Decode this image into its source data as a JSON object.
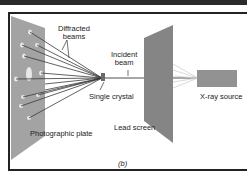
{
  "figure": {
    "labels": {
      "diffracted": [
        "Diffracted",
        "beams"
      ],
      "incident": [
        "Incident",
        "beam"
      ],
      "crystal": "Single crystal",
      "xray": "X-ray source",
      "plate": "Photographic plate",
      "screen": "Lead screen",
      "panel": "(b)"
    },
    "colors": {
      "plate": "#9a9a9a",
      "screen": "#7d7d7d",
      "source": "#8f8f8f",
      "beam": "#3a3a3a"
    }
  }
}
